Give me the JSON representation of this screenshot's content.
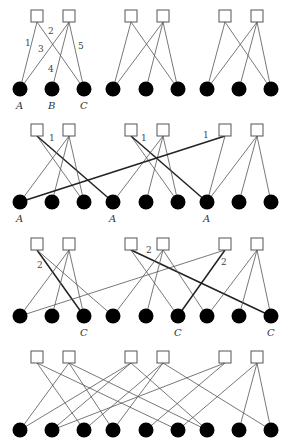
{
  "figure": {
    "width": 291,
    "height": 446,
    "colors": {
      "square_fill": "#ffffff",
      "square_stroke": "#555555",
      "circle_fill": "#000000",
      "edge": "#555555",
      "bold_edge": "#222222"
    }
  },
  "rows": [
    {
      "id": "row1",
      "top_y": 16,
      "bottom_y": 89,
      "squares": [
        {
          "x": 37
        },
        {
          "x": 69
        },
        {
          "x": 131
        },
        {
          "x": 163
        },
        {
          "x": 225
        },
        {
          "x": 257
        }
      ],
      "circles": [
        {
          "x": 20,
          "label": "A"
        },
        {
          "x": 52,
          "label": "B"
        },
        {
          "x": 84,
          "label": "C"
        },
        {
          "x": 113
        },
        {
          "x": 146
        },
        {
          "x": 178
        },
        {
          "x": 207
        },
        {
          "x": 239
        },
        {
          "x": 271
        }
      ],
      "edges": [
        {
          "s": 0,
          "c": 0,
          "label": "1",
          "lx": 25,
          "ly": 46
        },
        {
          "s": 0,
          "c": 2,
          "label": "2",
          "lx": 48,
          "ly": 34
        },
        {
          "s": 1,
          "c": 0,
          "label": "3",
          "lx": 38,
          "ly": 52
        },
        {
          "s": 1,
          "c": 1,
          "label": "4",
          "lx": 48,
          "ly": 72
        },
        {
          "s": 1,
          "c": 2,
          "label": "5",
          "lx": 78,
          "ly": 49
        },
        {
          "s": 2,
          "c": 3
        },
        {
          "s": 2,
          "c": 5
        },
        {
          "s": 3,
          "c": 3
        },
        {
          "s": 3,
          "c": 4
        },
        {
          "s": 3,
          "c": 5
        },
        {
          "s": 4,
          "c": 6
        },
        {
          "s": 4,
          "c": 8
        },
        {
          "s": 5,
          "c": 6
        },
        {
          "s": 5,
          "c": 7
        },
        {
          "s": 5,
          "c": 8
        }
      ]
    },
    {
      "id": "row2",
      "top_y": 130,
      "bottom_y": 202,
      "squares": [
        {
          "x": 37
        },
        {
          "x": 69
        },
        {
          "x": 131
        },
        {
          "x": 163
        },
        {
          "x": 225
        },
        {
          "x": 257
        }
      ],
      "circles": [
        {
          "x": 20,
          "label": "A"
        },
        {
          "x": 52
        },
        {
          "x": 84
        },
        {
          "x": 113,
          "label": "A"
        },
        {
          "x": 146
        },
        {
          "x": 178
        },
        {
          "x": 207,
          "label": "A"
        },
        {
          "x": 239
        },
        {
          "x": 271
        }
      ],
      "edges": [
        {
          "s": 0,
          "c": 2
        },
        {
          "s": 0,
          "c": 3,
          "bold": true,
          "label": "1",
          "lx": 49,
          "ly": 141
        },
        {
          "s": 1,
          "c": 0
        },
        {
          "s": 1,
          "c": 1
        },
        {
          "s": 1,
          "c": 2
        },
        {
          "s": 2,
          "c": 5
        },
        {
          "s": 2,
          "c": 6,
          "bold": true,
          "label": "1",
          "lx": 141,
          "ly": 141
        },
        {
          "s": 3,
          "c": 3
        },
        {
          "s": 3,
          "c": 4
        },
        {
          "s": 3,
          "c": 5
        },
        {
          "s": 4,
          "c": 0,
          "bold": true,
          "label": "1",
          "lx": 203,
          "ly": 138
        },
        {
          "s": 4,
          "c": 6
        },
        {
          "s": 5,
          "c": 7
        },
        {
          "s": 5,
          "c": 8
        },
        {
          "s": 5,
          "c": 6
        }
      ]
    },
    {
      "id": "row3",
      "top_y": 244,
      "bottom_y": 316,
      "squares": [
        {
          "x": 37
        },
        {
          "x": 69
        },
        {
          "x": 131
        },
        {
          "x": 163
        },
        {
          "x": 225
        },
        {
          "x": 257
        }
      ],
      "circles": [
        {
          "x": 20
        },
        {
          "x": 52
        },
        {
          "x": 84,
          "label": "C"
        },
        {
          "x": 113
        },
        {
          "x": 146
        },
        {
          "x": 178,
          "label": "C"
        },
        {
          "x": 207
        },
        {
          "x": 239
        },
        {
          "x": 271,
          "label": "C"
        }
      ],
      "edges": [
        {
          "s": 0,
          "c": 2,
          "bold": true,
          "label": "2",
          "lx": 37,
          "ly": 268
        },
        {
          "s": 0,
          "c": 3
        },
        {
          "s": 1,
          "c": 0
        },
        {
          "s": 1,
          "c": 1
        },
        {
          "s": 1,
          "c": 2
        },
        {
          "s": 2,
          "c": 5
        },
        {
          "s": 2,
          "c": 8,
          "bold": true,
          "label": "2",
          "lx": 146,
          "ly": 253
        },
        {
          "s": 3,
          "c": 3
        },
        {
          "s": 3,
          "c": 4
        },
        {
          "s": 3,
          "c": 6
        },
        {
          "s": 4,
          "c": 0
        },
        {
          "s": 4,
          "c": 5,
          "bold": true,
          "label": "2",
          "lx": 221,
          "ly": 265
        },
        {
          "s": 5,
          "c": 6
        },
        {
          "s": 5,
          "c": 7
        },
        {
          "s": 5,
          "c": 8
        }
      ]
    },
    {
      "id": "row4",
      "top_y": 357,
      "bottom_y": 430,
      "squares": [
        {
          "x": 37
        },
        {
          "x": 69
        },
        {
          "x": 131
        },
        {
          "x": 163
        },
        {
          "x": 225
        },
        {
          "x": 257
        }
      ],
      "circles": [
        {
          "x": 20
        },
        {
          "x": 52
        },
        {
          "x": 84
        },
        {
          "x": 113
        },
        {
          "x": 146
        },
        {
          "x": 178
        },
        {
          "x": 207
        },
        {
          "x": 239
        },
        {
          "x": 271
        }
      ],
      "edges": [
        {
          "s": 0,
          "c": 2
        },
        {
          "s": 0,
          "c": 5
        },
        {
          "s": 1,
          "c": 0
        },
        {
          "s": 1,
          "c": 3
        },
        {
          "s": 1,
          "c": 6
        },
        {
          "s": 2,
          "c": 0
        },
        {
          "s": 2,
          "c": 1
        },
        {
          "s": 2,
          "c": 6
        },
        {
          "s": 3,
          "c": 2
        },
        {
          "s": 3,
          "c": 3
        },
        {
          "s": 3,
          "c": 8
        },
        {
          "s": 4,
          "c": 1
        },
        {
          "s": 4,
          "c": 4
        },
        {
          "s": 5,
          "c": 5
        },
        {
          "s": 5,
          "c": 7
        },
        {
          "s": 5,
          "c": 8
        }
      ]
    }
  ]
}
